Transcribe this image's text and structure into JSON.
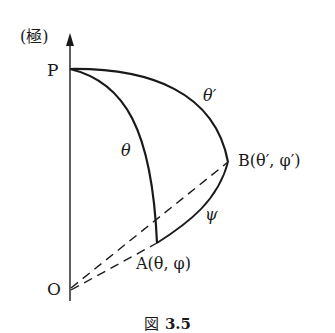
{
  "diagram": {
    "axis_label": "(極)",
    "points": {
      "P": "P",
      "O": "O",
      "A": "A(θ, φ)",
      "B": "B(θ′, φ′)"
    },
    "arc_labels": {
      "theta": "θ",
      "theta_prime": "θ′",
      "psi": "ψ"
    }
  },
  "caption": {
    "prefix": "図",
    "number": "3.5"
  }
}
